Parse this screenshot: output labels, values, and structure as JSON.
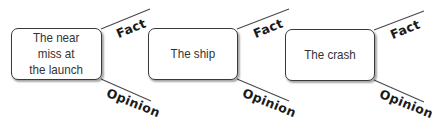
{
  "diagram": {
    "nodes": [
      {
        "label": "The near miss at the launch",
        "lines": [
          "The near",
          "miss at",
          "the launch"
        ]
      },
      {
        "label": "The ship",
        "lines": [
          "The ship"
        ]
      },
      {
        "label": "The crash",
        "lines": [
          "The crash"
        ]
      }
    ],
    "branches": {
      "top_label": "Fact",
      "bottom_label": "Opinion"
    },
    "colors": {
      "stroke": "#3a3a3a",
      "text": "#333333",
      "background": "#ffffff"
    }
  }
}
